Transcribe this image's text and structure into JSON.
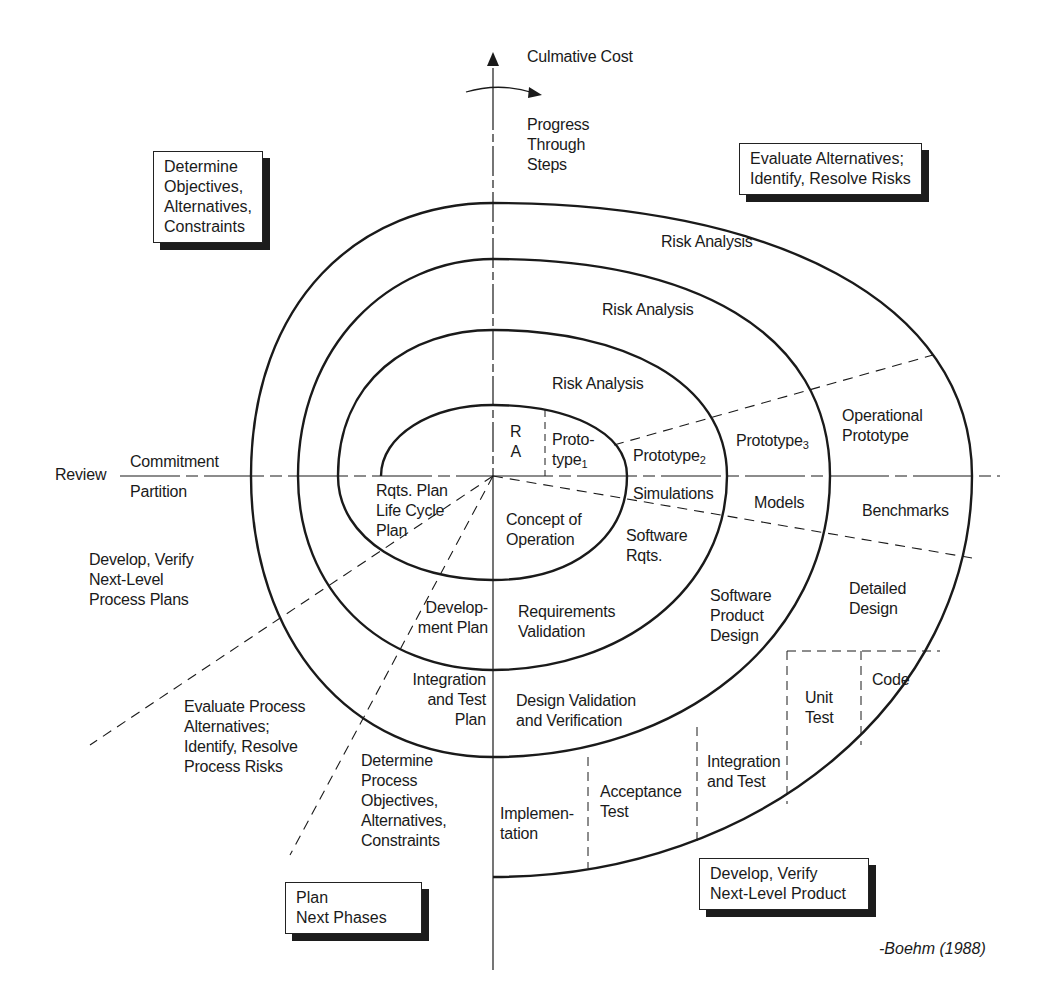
{
  "axes": {
    "vertical_label": "Culmative Cost",
    "rotation_label": [
      "Progress",
      "Through",
      "Steps"
    ],
    "horizontal_left_label": "Review",
    "horizontal_upper_label": "Commitment",
    "horizontal_lower_label": "Partition"
  },
  "quadrant_boxes": {
    "top_left": [
      "Determine",
      "Objectives,",
      "Alternatives,",
      "Constraints"
    ],
    "top_right": [
      "Evaluate Alternatives;",
      "Identify, Resolve Risks"
    ],
    "bottom_left": [
      "Plan",
      "Next Phases"
    ],
    "bottom_right": [
      "Develop, Verify",
      "Next-Level Product"
    ]
  },
  "risk_analysis": {
    "ring1": "Risk Analysis",
    "ring2": "Risk Analysis",
    "ring3": "Risk Analysis",
    "ring0_short": [
      "R",
      "A"
    ]
  },
  "prototypes": {
    "p1": [
      "Proto-",
      "type"
    ],
    "p1_sub": "1",
    "p2": "Prototype",
    "p2_sub": "2",
    "p3": "Prototype",
    "p3_sub": "3",
    "operational": [
      "Operational",
      "Prototype"
    ]
  },
  "lower_right_steps": {
    "simulations": "Simulations",
    "models": "Models",
    "benchmarks": "Benchmarks",
    "concept": [
      "Concept of",
      "Operation"
    ],
    "software_rqts": [
      "Software",
      "Rqts."
    ],
    "requirements_validation": [
      "Requirements",
      "Validation"
    ],
    "software_product_design": [
      "Software",
      "Product",
      "Design"
    ],
    "detailed_design": [
      "Detailed",
      "Design"
    ],
    "design_validation": [
      "Design Validation",
      "and Verification"
    ],
    "code": "Code",
    "unit_test": [
      "Unit",
      "Test"
    ],
    "integration_test": [
      "Integration",
      "and Test"
    ],
    "acceptance_test": [
      "Acceptance",
      "Test"
    ],
    "implementation": [
      "Implemen-",
      "tation"
    ]
  },
  "lower_left_steps": {
    "rqts_plan": [
      "Rqts. Plan",
      "Life Cycle",
      "Plan"
    ],
    "development_plan": [
      "Develop-",
      "ment Plan"
    ],
    "integration_test_plan": [
      "Integration",
      "and Test",
      "Plan"
    ],
    "develop_verify_process": [
      "Develop, Verify",
      "Next-Level",
      "Process Plans"
    ],
    "evaluate_process": [
      "Evaluate Process",
      "Alternatives;",
      "Identify, Resolve",
      "Process Risks"
    ],
    "determine_process": [
      "Determine",
      "Process",
      "Objectives,",
      "Alternatives,",
      "Constraints"
    ]
  },
  "citation": "-Boehm (1988)",
  "colors": {
    "ink": "#1a1a1a",
    "background": "#ffffff",
    "shadow": "#1c1c1c"
  }
}
